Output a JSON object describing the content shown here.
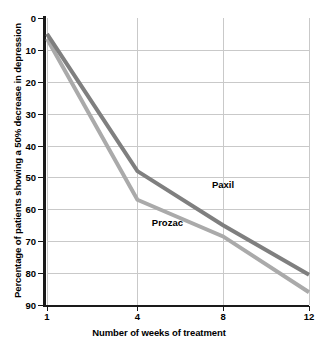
{
  "chart_data": {
    "type": "line",
    "title": "",
    "xlabel": "Number of weeks of treatment",
    "ylabel": "Percentage of patients showing a 50% decrease in depression",
    "x": [
      1,
      4,
      8,
      12
    ],
    "xtick_labels": [
      "1",
      "4",
      "8",
      "12"
    ],
    "ytick_labels": [
      "0",
      "10",
      "20",
      "30",
      "40",
      "50",
      "60",
      "70",
      "80",
      "90"
    ],
    "ytick_values": [
      0,
      10,
      20,
      30,
      40,
      50,
      60,
      70,
      80,
      90
    ],
    "ylim": [
      0,
      90
    ],
    "y_axis_inverted": true,
    "grid": true,
    "legend_position": "inline-annotation",
    "series": [
      {
        "name": "Paxil",
        "color": "#7f7f7f",
        "values": [
          5,
          48,
          65,
          80.5
        ],
        "label_x": 8,
        "label_y": 52
      },
      {
        "name": "Prozac",
        "color": "#aaaaaa",
        "values": [
          6.5,
          57,
          68.5,
          86
        ],
        "label_x": 5.4,
        "label_y": 64
      }
    ]
  },
  "axes": {
    "y_title": "Percentage of patients showing a 50% decrease in depression",
    "x_title": "Number of weeks of treatment"
  }
}
